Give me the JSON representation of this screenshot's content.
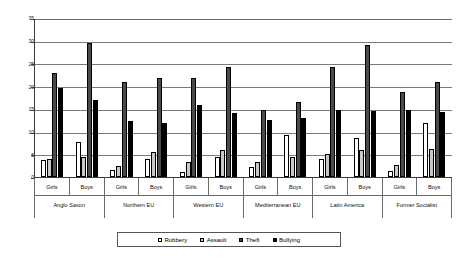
{
  "chart_data": {
    "type": "bar",
    "title": "",
    "xlabel": "",
    "ylabel": "",
    "ylim": [
      0,
      35
    ],
    "yticks": [
      0,
      5,
      10,
      15,
      20,
      25,
      30,
      35
    ],
    "grid": true,
    "legend_position": "bottom",
    "categories": [
      "Anglo Saxon - Girls",
      "Anglo Saxon - Boys",
      "Northern EU - Girls",
      "Northern EU - Boys",
      "Western EU - Girls",
      "Western EU - Boys",
      "Mediterranean EU - Girls",
      "Mediterranean EU - Boys",
      "Latin America - Girls",
      "Latin America - Boys",
      "Former Socialist - Girls",
      "Former Socialist - Boys"
    ],
    "regions": [
      {
        "name": "Anglo Saxon",
        "genders": [
          {
            "label": "Girls",
            "values": [
              3.8,
              4.0,
              23.0,
              19.5
            ]
          },
          {
            "label": "Boys",
            "values": [
              7.7,
              4.4,
              29.5,
              17.0
            ]
          }
        ]
      },
      {
        "name": "Northern EU",
        "genders": [
          {
            "label": "Girls",
            "values": [
              1.6,
              2.5,
              21.0,
              12.3
            ]
          },
          {
            "label": "Boys",
            "values": [
              4.0,
              5.6,
              21.8,
              12.0
            ]
          }
        ]
      },
      {
        "name": "Western EU",
        "genders": [
          {
            "label": "Girls",
            "values": [
              1.2,
              3.3,
              21.7,
              15.8
            ]
          },
          {
            "label": "Boys",
            "values": [
              4.5,
              6.0,
              24.3,
              14.0
            ]
          }
        ]
      },
      {
        "name": "Mediterranean EU",
        "genders": [
          {
            "label": "Girls",
            "values": [
              2.1,
              3.2,
              14.8,
              12.5
            ]
          },
          {
            "label": "Boys",
            "values": [
              9.3,
              4.4,
              16.5,
              13.0
            ]
          }
        ]
      },
      {
        "name": "Latin America",
        "genders": [
          {
            "label": "Girls",
            "values": [
              3.9,
              5.0,
              24.2,
              14.8
            ]
          },
          {
            "label": "Boys",
            "values": [
              8.6,
              6.0,
              29.0,
              14.6
            ]
          }
        ]
      },
      {
        "name": "Former Socialist",
        "genders": [
          {
            "label": "Girls",
            "values": [
              1.4,
              2.7,
              18.8,
              14.8
            ]
          },
          {
            "label": "Boys",
            "values": [
              11.8,
              6.2,
              21.0,
              14.3
            ]
          }
        ]
      }
    ],
    "series": [
      {
        "name": "Robbery",
        "color": "#ffffff",
        "values": [
          3.8,
          7.7,
          1.6,
          4.0,
          1.2,
          4.5,
          2.1,
          9.3,
          3.9,
          8.6,
          1.4,
          11.8
        ]
      },
      {
        "name": "Assault",
        "color": "#c8c8c8",
        "values": [
          4.0,
          4.4,
          2.5,
          5.6,
          3.3,
          6.0,
          3.2,
          4.4,
          5.0,
          6.0,
          2.7,
          6.2
        ]
      },
      {
        "name": "Theft",
        "color": "#4a4a4a",
        "values": [
          23.0,
          29.5,
          21.0,
          21.8,
          21.7,
          24.3,
          14.8,
          16.5,
          24.2,
          29.0,
          18.8,
          21.0
        ]
      },
      {
        "name": "Bullying",
        "color": "#000000",
        "values": [
          19.5,
          17.0,
          12.3,
          12.0,
          15.8,
          14.0,
          12.5,
          13.0,
          14.8,
          14.6,
          14.8,
          14.3
        ]
      }
    ]
  },
  "legend": {
    "items": [
      {
        "label": "Robbery"
      },
      {
        "label": "Assault"
      },
      {
        "label": "Theft"
      },
      {
        "label": "Bullying"
      }
    ]
  }
}
